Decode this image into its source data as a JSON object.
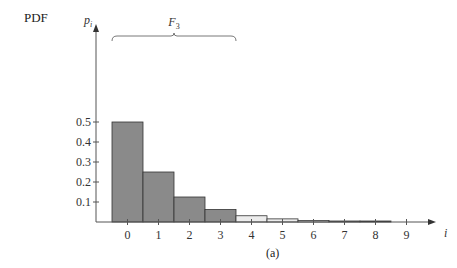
{
  "label": "PDF",
  "caption": "(a)",
  "chart_data": {
    "type": "bar",
    "title": "PDF",
    "xlabel": "i",
    "ylabel": "p_i",
    "categories": [
      "0",
      "1",
      "2",
      "3",
      "4",
      "5",
      "6",
      "7",
      "8"
    ],
    "values": [
      0.5,
      0.25,
      0.125,
      0.0625,
      0.03125,
      0.015625,
      0.0078125,
      0.00390625,
      0.001953125
    ],
    "x_ticks": [
      "0",
      "1",
      "2",
      "3",
      "4",
      "5",
      "6",
      "7",
      "8",
      "9"
    ],
    "y_ticks": [
      "0.1",
      "0.2",
      "0.3",
      "0.4",
      "0.5"
    ],
    "ylim": [
      0,
      0.55
    ],
    "annotation": {
      "text": "F_3",
      "spans": [
        "0",
        "1",
        "2",
        "3"
      ]
    },
    "bar_colors": [
      "#8a8a8a",
      "#8a8a8a",
      "#8a8a8a",
      "#8a8a8a",
      "#ececec",
      "#ececec",
      "#ececec",
      "#8a8a8a",
      "#222222"
    ],
    "caption": "(a)",
    "grid": false
  }
}
